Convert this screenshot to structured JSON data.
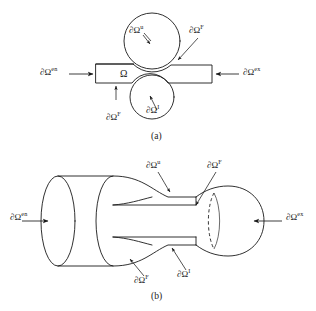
{
  "figure": {
    "background_color": "#ffffff",
    "line_color": "#1a1a1a",
    "panels": [
      {
        "id": "panel-a",
        "caption": "(a)",
        "description": "2D schematic: rectangular domain Omega constricted by two circular obstacles",
        "labels": [
          {
            "name": "inlet-boundary",
            "base": "∂Ω",
            "sup": "en",
            "text": "∂Ωen"
          },
          {
            "name": "outlet-boundary",
            "base": "∂Ω",
            "sup": "ex",
            "text": "∂Ωex"
          },
          {
            "name": "displacement-boundary-upper",
            "base": "∂Ω",
            "sup": "u",
            "text": "∂Ωu"
          },
          {
            "name": "traction-boundary-upper",
            "base": "∂Ω",
            "sup": "F",
            "text": "∂ΩF"
          },
          {
            "name": "traction-boundary-lower",
            "base": "∂Ω",
            "sup": "F",
            "text": "∂ΩF"
          },
          {
            "name": "interface-boundary-lower",
            "base": "∂Ω",
            "sup": "I",
            "text": "∂ΩI"
          },
          {
            "name": "domain-symbol",
            "base": "Ω",
            "sup": "",
            "text": "Ω"
          }
        ]
      },
      {
        "id": "panel-b",
        "caption": "(b)",
        "description": "3D axisymmetric solid of revolution: cylinder narrowing into a throat and opening into a sphere-like end",
        "labels": [
          {
            "name": "inlet-boundary",
            "base": "∂Ω",
            "sup": "en",
            "text": "∂Ωen"
          },
          {
            "name": "outlet-boundary",
            "base": "∂Ω",
            "sup": "ex",
            "text": "∂Ωex"
          },
          {
            "name": "displacement-boundary-upper",
            "base": "∂Ω",
            "sup": "u",
            "text": "∂Ωu"
          },
          {
            "name": "traction-boundary-upper",
            "base": "∂Ω",
            "sup": "F",
            "text": "∂ΩF"
          },
          {
            "name": "traction-boundary-lower",
            "base": "∂Ω",
            "sup": "F",
            "text": "∂ΩF"
          },
          {
            "name": "interface-boundary-lower",
            "base": "∂Ω",
            "sup": "I",
            "text": "∂ΩI"
          }
        ]
      }
    ]
  },
  "panel_a": {
    "caption": "(a)",
    "omega": "Ω",
    "inlet": {
      "base": "∂Ω",
      "sup": "en"
    },
    "outlet": {
      "base": "∂Ω",
      "sup": "ex"
    },
    "upper_u": {
      "base": "∂Ω",
      "sup": "u"
    },
    "upper_F": {
      "base": "∂Ω",
      "sup": "F"
    },
    "lower_F": {
      "base": "∂Ω",
      "sup": "F"
    },
    "lower_I": {
      "base": "∂Ω",
      "sup": "I"
    }
  },
  "panel_b": {
    "caption": "(b)",
    "inlet": {
      "base": "∂Ω",
      "sup": "en"
    },
    "outlet": {
      "base": "∂Ω",
      "sup": "ex"
    },
    "upper_u": {
      "base": "∂Ω",
      "sup": "u"
    },
    "upper_F": {
      "base": "∂Ω",
      "sup": "F"
    },
    "lower_F": {
      "base": "∂Ω",
      "sup": "F"
    },
    "lower_I": {
      "base": "∂Ω",
      "sup": "I"
    }
  }
}
